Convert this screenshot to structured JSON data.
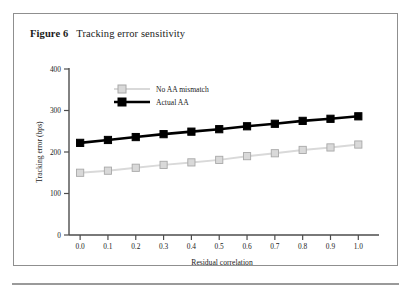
{
  "figure": {
    "number_label": "Figure 6",
    "title": "Tracking error sensitivity"
  },
  "chart_data": {
    "type": "line",
    "title": "Tracking error sensitivity",
    "xlabel": "Residual correlation",
    "ylabel": "Tracking error (bps)",
    "x": [
      0.0,
      0.1,
      0.2,
      0.3,
      0.4,
      0.5,
      0.6,
      0.7,
      0.8,
      0.9,
      1.0
    ],
    "xtick_labels": [
      "0.0",
      "0.1",
      "0.2",
      "0.3",
      "0.4",
      "0.5",
      "0.6",
      "0.7",
      "0.8",
      "0.9",
      "1.0"
    ],
    "ytick_labels": [
      "0",
      "100",
      "200",
      "300",
      "400"
    ],
    "yticks": [
      0,
      100,
      200,
      300,
      400
    ],
    "xlim": [
      -0.04,
      1.06
    ],
    "ylim": [
      0,
      400
    ],
    "grid": false,
    "legend_position": "upper-left-inside",
    "series": [
      {
        "name": "No AA mismatch",
        "color": "#d9d9d9",
        "marker": "square",
        "marker_fill": "#d9d9d9",
        "marker_edge": "#a8a8a8",
        "values": [
          150,
          155,
          162,
          169,
          175,
          181,
          190,
          197,
          205,
          211,
          218
        ]
      },
      {
        "name": "Actual AA",
        "color": "#000000",
        "marker": "square",
        "marker_fill": "#000000",
        "marker_edge": "#000000",
        "values": [
          222,
          229,
          236,
          243,
          249,
          255,
          262,
          268,
          275,
          280,
          286
        ]
      }
    ]
  },
  "colors": {
    "panel_border": "#8f8f8f",
    "axis": "#4d4d4d",
    "rule": "#9a9a9a"
  }
}
